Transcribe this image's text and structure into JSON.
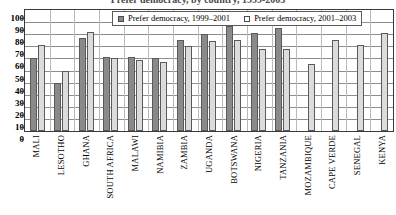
{
  "chart_data": {
    "type": "bar",
    "title": "Prefer democracy, by country, 1999-2003",
    "xlabel": "",
    "ylabel": "",
    "ylim": [
      0,
      100
    ],
    "ytick_values": [
      100,
      90,
      80,
      70,
      60,
      50,
      40,
      30,
      20,
      10,
      0
    ],
    "ytick_labels": [
      "100",
      "90",
      "80",
      "70",
      "60",
      "50",
      "40",
      "30",
      "20",
      "10",
      "0"
    ],
    "grid": true,
    "legend_position": "top-center",
    "categories": [
      "MALI",
      "LESOTHO",
      "GHANA",
      "SOUTH AFRICA",
      "MALAWI",
      "NAMIBIA",
      "ZAMBIA",
      "UGANDA",
      "BOTSWANA",
      "NIGERIA",
      "TANZANIA",
      "MOZAMBIQUE",
      "CAPE VERDE",
      "SENEGAL",
      "KENYA"
    ],
    "series": [
      {
        "name": "Prefer democracy, 1999–2001",
        "color": "#8a8a8a",
        "values": [
          60,
          40,
          77,
          61,
          61,
          60,
          75,
          80,
          87,
          81,
          85,
          null,
          null,
          null,
          null
        ]
      },
      {
        "name": "Prefer democracy, 2001–2003",
        "color": "#dcdcdc",
        "values": [
          71,
          50,
          82,
          60,
          59,
          57,
          70,
          74,
          75,
          68,
          68,
          55,
          75,
          71,
          81
        ]
      }
    ]
  },
  "legend": {
    "items": [
      {
        "label": "Prefer democracy, 1999–2001",
        "swatch": "series-1-swatch"
      },
      {
        "label": "Prefer democracy, 2001–2003",
        "swatch": "series-2-swatch"
      }
    ]
  }
}
